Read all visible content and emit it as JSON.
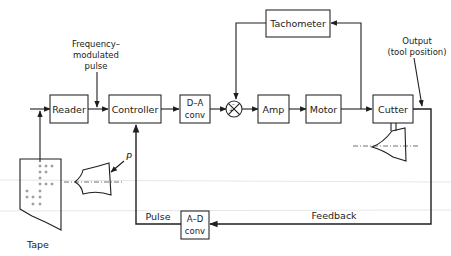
{
  "diagram": {
    "blocks": {
      "reader": "Reader",
      "controller": "Controller",
      "da_conv_line1": "D–A",
      "da_conv_line2": "conv",
      "amp": "Amp",
      "motor": "Motor",
      "cutter": "Cutter",
      "tachometer": "Tachometer",
      "ad_conv_line1": "A–D",
      "ad_conv_line2": "conv"
    },
    "labels": {
      "freq_line1": "Frequency–",
      "freq_line2": "modulated",
      "freq_line3": "pulse",
      "output_line1": "Output",
      "output_line2": "(tool position)",
      "pulse": "Pulse",
      "feedback": "Feedback",
      "tape": "Tape",
      "p": "P"
    },
    "summing_junction": {
      "plus": "+",
      "minus": "–"
    }
  }
}
